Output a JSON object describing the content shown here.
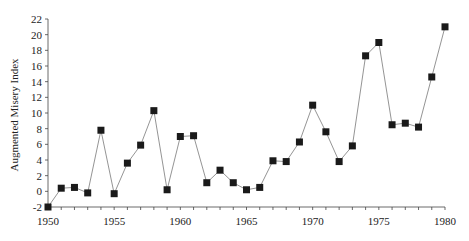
{
  "chart_data": {
    "type": "line",
    "title": "",
    "xlabel": "",
    "ylabel": "Augmented Misery Index",
    "x": [
      1950,
      1951,
      1952,
      1953,
      1954,
      1955,
      1956,
      1957,
      1958,
      1959,
      1960,
      1961,
      1962,
      1963,
      1964,
      1965,
      1966,
      1967,
      1968,
      1969,
      1970,
      1971,
      1972,
      1973,
      1974,
      1975,
      1976,
      1977,
      1978,
      1979,
      1980
    ],
    "series": [
      {
        "name": "Augmented Misery Index",
        "values": [
          -2.0,
          0.4,
          0.5,
          -0.2,
          7.8,
          -0.3,
          3.6,
          5.9,
          10.3,
          0.2,
          7.0,
          7.1,
          1.1,
          2.7,
          1.1,
          0.2,
          0.5,
          3.9,
          3.8,
          6.3,
          11.0,
          7.6,
          3.8,
          5.8,
          17.3,
          19.0,
          8.5,
          8.7,
          8.2,
          14.6,
          21.0
        ]
      }
    ],
    "xlim": [
      1950,
      1980
    ],
    "ylim": [
      -2,
      22
    ],
    "x_ticks": [
      "1950",
      "1955",
      "1960",
      "1965",
      "1970",
      "1975",
      "1980"
    ],
    "y_ticks": [
      "-2",
      "0",
      "2",
      "4",
      "6",
      "8",
      "10",
      "12",
      "14",
      "16",
      "18",
      "20",
      "22"
    ],
    "grid": false,
    "legend": null,
    "marker": "square",
    "colors": {
      "line": "#888888",
      "marker": "#1a1a1a",
      "axis": "#444444"
    }
  }
}
